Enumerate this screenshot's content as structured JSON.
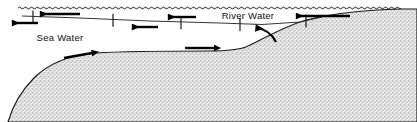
{
  "figure": {
    "width": 417,
    "height": 122,
    "background_color": "#ffffff"
  },
  "labels": {
    "sea_water": "Sea Water",
    "river_water": "River Water"
  },
  "colors": {
    "line": "#1a1a1a",
    "arrow": "#000000",
    "sediment_fill": "#e8e8e8",
    "sediment_stipple": "#8a8a8a",
    "sediment_outline": "#1a1a1a",
    "water_surface": "#1a1a1a",
    "interface": "#2a2a2a"
  },
  "diagram": {
    "water_surface": {
      "name": "wavy-water-surface",
      "x_start": 18,
      "x_end": 401,
      "y": 8,
      "wave_period": 6,
      "wave_amplitude": 1.8
    },
    "halocline": {
      "name": "salt-wedge-interface",
      "points": "22,16 80,18 150,21 220,23 262,24.5 300,22 322,17"
    },
    "tick_marks": [
      {
        "x": 33,
        "y": 16.6,
        "top": 6,
        "bottom": 7
      },
      {
        "x": 113,
        "y": 19.7,
        "top": 6,
        "bottom": 7
      },
      {
        "x": 181,
        "y": 22.2,
        "top": 6,
        "bottom": 7
      },
      {
        "x": 240,
        "y": 23.9,
        "top": 6,
        "bottom": 7
      },
      {
        "x": 306,
        "y": 20.6,
        "top": 6,
        "bottom": 7
      }
    ],
    "arrows": [
      {
        "name": "surface-flow-arrow-left-1",
        "direction": "left",
        "x1": 80,
        "y1": 14,
        "x2": 40,
        "y2": 14,
        "width": 2.4,
        "head": 7
      },
      {
        "name": "sea-water-return-arrow-left",
        "direction": "left",
        "x1": 38,
        "y1": 23,
        "x2": 12,
        "y2": 23,
        "width": 2.4,
        "head": 7
      },
      {
        "name": "lower-layer-arrow-left-1",
        "direction": "left",
        "x1": 158,
        "y1": 27,
        "x2": 132,
        "y2": 27,
        "width": 2.4,
        "head": 7
      },
      {
        "name": "surface-flow-arrow-left-2",
        "direction": "left",
        "x1": 196,
        "y1": 17,
        "x2": 168,
        "y2": 17,
        "width": 2.4,
        "head": 7
      },
      {
        "name": "river-inflow-arrow-left",
        "direction": "left",
        "x1": 350,
        "y1": 16,
        "x2": 296,
        "y2": 16,
        "width": 2.4,
        "head": 7
      },
      {
        "name": "salt-wedge-arrow-right-1",
        "direction": "right",
        "x1": 64,
        "y1": 58,
        "x2": 92,
        "y2": 53,
        "width": 2.4,
        "head": 7
      },
      {
        "name": "salt-wedge-arrow-right-2",
        "direction": "right",
        "x1": 185,
        "y1": 48,
        "x2": 214,
        "y2": 48,
        "width": 2.4,
        "head": 7
      },
      {
        "name": "entrainment-curved-arrow",
        "direction": "curved-up-left",
        "path": "M 276,42 C 272,34 266,29 256,28",
        "head": 7
      }
    ],
    "sediment": {
      "name": "sediment-bed",
      "outline": "M 8,122 C 12,108 20,92 34,78 C 50,62 72,55 95,53 C 130,51 170,51 208,51 C 228,51 240,50 248,46 C 262,40 280,28 306,20 C 330,14 360,10 401,9 L 417,9 L 417,122 Z"
    },
    "label_positions": {
      "sea_water": {
        "x": 60,
        "y": 41
      },
      "river_water": {
        "x": 248,
        "y": 19
      }
    }
  }
}
